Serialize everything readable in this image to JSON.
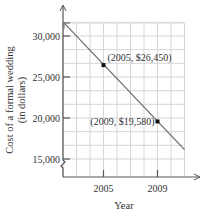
{
  "chart_data": {
    "type": "line",
    "title": "",
    "xlabel": "Year",
    "ylabel_line1": "Cost of a formal wedding",
    "ylabel_line2": "(in dollars)",
    "x_ticks": [
      {
        "value": 2005,
        "label": "2005"
      },
      {
        "value": 2009,
        "label": "2009"
      }
    ],
    "y_ticks": [
      {
        "value": 15000,
        "label": "15,000"
      },
      {
        "value": 20000,
        "label": "20,000"
      },
      {
        "value": 25000,
        "label": "25,000"
      },
      {
        "value": 30000,
        "label": "30,000"
      }
    ],
    "xlim": [
      2002,
      2011
    ],
    "ylim": [
      13500,
      31500
    ],
    "grid": true,
    "axis_break_y": true,
    "points": [
      {
        "x": 2005,
        "y": 26450,
        "label": "(2005, $26,450)"
      },
      {
        "x": 2009,
        "y": 19580,
        "label": "(2009, $19,580)"
      }
    ],
    "series": [
      {
        "name": "Cost trend line",
        "x": [
          2002,
          2011
        ],
        "y": [
          31602.5,
          16145
        ],
        "color": "#6e6e6e"
      }
    ]
  }
}
